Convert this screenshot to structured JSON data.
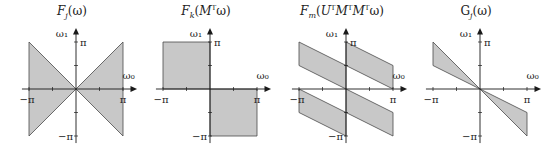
{
  "figure": {
    "fill_color": "#c8c8c8",
    "edge_color": "#4a4a4a",
    "axis_color": "#1a1a1a",
    "axis_labels": {
      "x": "ω₀",
      "y": "ω₁"
    },
    "tick_labels": {
      "pos": "π",
      "neg": "−π"
    }
  },
  "panels": [
    {
      "title": "F_j(ω)",
      "title_html_main": "F",
      "title_sub": "j",
      "title_rest": "(ω)",
      "shape": "bowtie",
      "regions": [
        [
          [
            -1,
            1
          ],
          [
            0,
            0
          ],
          [
            -1,
            -1
          ]
        ],
        [
          [
            1,
            1
          ],
          [
            0,
            0
          ],
          [
            1,
            -1
          ]
        ]
      ]
    },
    {
      "title": "F_k(M^T ω)",
      "title_html_main": "F",
      "title_sub": "k",
      "title_rest": "(MᵀΩ)",
      "shape": "quadrant-squares",
      "regions": [
        [
          [
            -1,
            0
          ],
          [
            -1,
            1
          ],
          [
            0,
            1
          ],
          [
            0,
            0
          ]
        ],
        [
          [
            0,
            0
          ],
          [
            1,
            0
          ],
          [
            1,
            -1
          ],
          [
            0,
            -1
          ]
        ]
      ]
    },
    {
      "title": "F_m(U^T M^T M^T ω)",
      "title_html_main": "F",
      "title_sub": "m",
      "title_rest": "(UᵀMᵀMᵀω)",
      "shape": "parallelograms",
      "regions": [
        [
          [
            -1,
            1
          ],
          [
            0,
            0.5
          ],
          [
            0,
            0
          ],
          [
            -1,
            0.5
          ]
        ],
        [
          [
            0,
            1
          ],
          [
            1,
            0.5
          ],
          [
            1,
            0
          ],
          [
            0,
            0.5
          ]
        ],
        [
          [
            -1,
            0
          ],
          [
            0,
            -0.5
          ],
          [
            0,
            -1
          ],
          [
            -1,
            -0.5
          ]
        ],
        [
          [
            0,
            0
          ],
          [
            1,
            -0.5
          ],
          [
            1,
            -1
          ],
          [
            0,
            -0.5
          ]
        ]
      ]
    },
    {
      "title": "G_j(ω)",
      "title_html_main": "G",
      "title_sub": "j",
      "title_rest": "(ω)",
      "shape": "double-wedge",
      "regions": [
        [
          [
            -1,
            1
          ],
          [
            0,
            0
          ],
          [
            -1,
            0.5
          ]
        ],
        [
          [
            1,
            -1
          ],
          [
            0,
            0
          ],
          [
            1,
            -0.5
          ]
        ]
      ]
    }
  ]
}
